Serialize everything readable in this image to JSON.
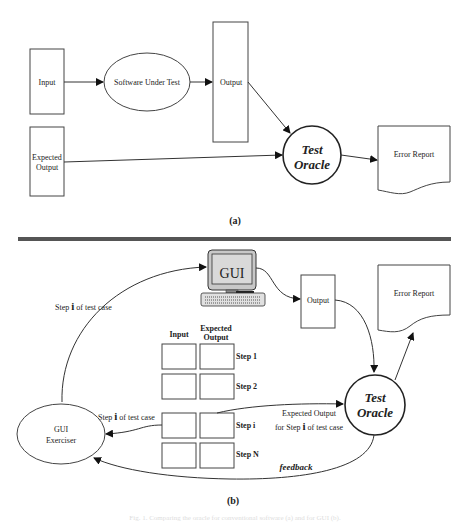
{
  "panel_a": {
    "label": "(a)",
    "input": "Input",
    "software_under_test": "Software Under Test",
    "output": "Output",
    "expected_output_line1": "Expected",
    "expected_output_line2": "Output",
    "oracle_line1": "Test",
    "oracle_line2": "Oracle",
    "error_report": "Error Report"
  },
  "panel_b": {
    "label": "(b)",
    "gui_screen_label": "GUI",
    "output": "Output",
    "error_report": "Error Report",
    "step_to_gui_prefix": "Step ",
    "step_to_gui_i": "i",
    "step_to_gui_suffix": " of test case",
    "table_header_input": "Input",
    "table_header_expected_line1": "Expected",
    "table_header_expected_line2": "Output",
    "steps": [
      "Step 1",
      "Step 2",
      "Step i",
      "Step N"
    ],
    "step_to_exerciser_prefix": "Step ",
    "step_to_exerciser_i": "i",
    "step_to_exerciser_suffix": " of test case",
    "exerciser_line1": "GUI",
    "exerciser_line2": "Exerciser",
    "expected_for_step_line1": "Expected Output",
    "expected_for_step_prefix": "for Step ",
    "expected_for_step_i": "i",
    "expected_for_step_suffix": " of test case",
    "oracle_line1": "Test",
    "oracle_line2": "Oracle",
    "feedback": "feedback"
  },
  "caption": "Fig. 1. Comparing the oracle for conventional software (a) and for GUI (b)."
}
